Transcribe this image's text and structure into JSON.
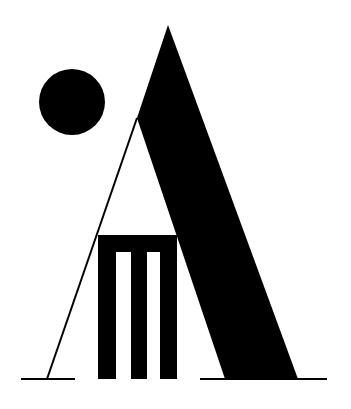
{
  "logo": {
    "description": "Monochrome logo: letter A formed by a black diagonal band and a thin line, with a cricket wicket (three stumps and bail) inside and a black ball at upper left",
    "colors": {
      "ink": "#000000",
      "background": "#ffffff"
    },
    "elements": {
      "ball": {
        "cx": 72,
        "cy": 102,
        "r": 33
      },
      "a_band": {
        "points": "168,25 298,379 225,379 137,118 135,120"
      },
      "a_thin_leg": {
        "x1": 137,
        "y1": 118,
        "x2": 47,
        "y2": 379,
        "stroke_width": 2
      },
      "wicket": {
        "bail": {
          "x": 98,
          "y": 235,
          "width": 79,
          "height": 17
        },
        "stumps": [
          {
            "x": 98,
            "y": 235,
            "width": 18,
            "height": 144
          },
          {
            "x": 131,
            "y": 235,
            "width": 16,
            "height": 144
          },
          {
            "x": 160,
            "y": 235,
            "width": 17,
            "height": 144
          }
        ]
      },
      "ground_lines": [
        {
          "x1": 21,
          "y1": 379,
          "x2": 75,
          "y2": 379
        },
        {
          "x1": 200,
          "y1": 379,
          "x2": 327,
          "y2": 379
        }
      ]
    }
  }
}
